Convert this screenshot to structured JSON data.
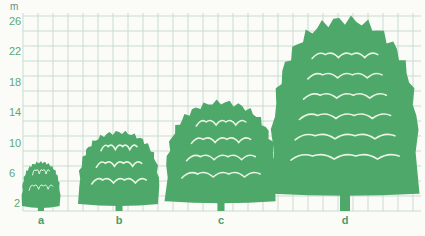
{
  "diagram": {
    "unit_label": "m",
    "colors": {
      "tree": "#4da86a",
      "grid": "#c9ddd0",
      "label": "#5fa776",
      "background": "#fbfbf8",
      "highlight": "#e8f4e4"
    },
    "y_axis": {
      "ticks": [
        "26",
        "22",
        "18",
        "14",
        "10",
        "6",
        "2"
      ]
    },
    "trees": [
      {
        "label": "a",
        "height_m": 6.5
      },
      {
        "label": "b",
        "height_m": 10.5
      },
      {
        "label": "c",
        "height_m": 14.5
      },
      {
        "label": "d",
        "height_m": 25.5
      }
    ]
  },
  "chart_data": {
    "type": "bar",
    "title": "",
    "xlabel": "",
    "ylabel": "m",
    "categories": [
      "a",
      "b",
      "c",
      "d"
    ],
    "values": [
      6.5,
      10.5,
      14.5,
      25.5
    ],
    "yticks": [
      2,
      6,
      10,
      14,
      18,
      22,
      26
    ],
    "ylim": [
      0,
      26
    ],
    "grid": true
  }
}
